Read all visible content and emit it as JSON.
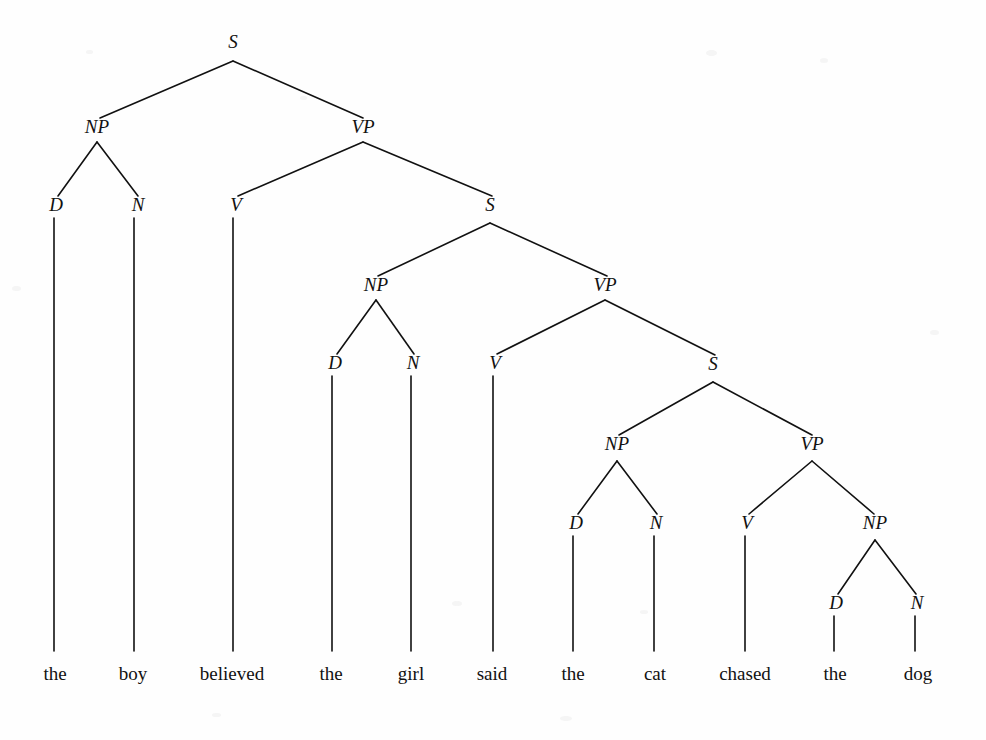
{
  "figure": {
    "kind": "constituency-syntax-tree",
    "sentence": "the boy believed the girl said the cat chased the dog",
    "background_color": "#fefefe",
    "ink_color": "#111111",
    "label_style": "italic-serif",
    "word_style": "roman-serif",
    "width": 986,
    "height": 740
  },
  "nodes": [
    {
      "id": "S1",
      "label": "S",
      "x": 233,
      "y": 48
    },
    {
      "id": "NP1",
      "label": "NP",
      "x": 97,
      "y": 133
    },
    {
      "id": "VP1",
      "label": "VP",
      "x": 363,
      "y": 133
    },
    {
      "id": "D1",
      "label": "D",
      "x": 56,
      "y": 211
    },
    {
      "id": "N1",
      "label": "N",
      "x": 138,
      "y": 211
    },
    {
      "id": "V1",
      "label": "V",
      "x": 236,
      "y": 211
    },
    {
      "id": "S2",
      "label": "S",
      "x": 490,
      "y": 211
    },
    {
      "id": "NP2",
      "label": "NP",
      "x": 376,
      "y": 291
    },
    {
      "id": "VP2",
      "label": "VP",
      "x": 605,
      "y": 291
    },
    {
      "id": "D2",
      "label": "D",
      "x": 335,
      "y": 369
    },
    {
      "id": "N2",
      "label": "N",
      "x": 413,
      "y": 369
    },
    {
      "id": "V2",
      "label": "V",
      "x": 495,
      "y": 369
    },
    {
      "id": "S3",
      "label": "S",
      "x": 713,
      "y": 370
    },
    {
      "id": "NP3",
      "label": "NP",
      "x": 617,
      "y": 450
    },
    {
      "id": "VP3",
      "label": "VP",
      "x": 812,
      "y": 450
    },
    {
      "id": "D3",
      "label": "D",
      "x": 576,
      "y": 529
    },
    {
      "id": "N3",
      "label": "N",
      "x": 656,
      "y": 529
    },
    {
      "id": "V3",
      "label": "V",
      "x": 747,
      "y": 529
    },
    {
      "id": "NP4",
      "label": "NP",
      "x": 875,
      "y": 529
    },
    {
      "id": "D4",
      "label": "D",
      "x": 836,
      "y": 609
    },
    {
      "id": "N4",
      "label": "N",
      "x": 917,
      "y": 609
    }
  ],
  "branches": [
    {
      "from": "S1",
      "to": "NP1",
      "ax": 233,
      "ay": 61,
      "bx": 100,
      "by": 118
    },
    {
      "from": "S1",
      "to": "VP1",
      "ax": 233,
      "ay": 61,
      "bx": 363,
      "by": 118
    },
    {
      "from": "NP1",
      "to": "D1",
      "ax": 97,
      "ay": 142,
      "bx": 58,
      "by": 196
    },
    {
      "from": "NP1",
      "to": "N1",
      "ax": 97,
      "ay": 142,
      "bx": 138,
      "by": 196
    },
    {
      "from": "VP1",
      "to": "V1",
      "ax": 363,
      "ay": 142,
      "bx": 238,
      "by": 196
    },
    {
      "from": "VP1",
      "to": "S2",
      "ax": 363,
      "ay": 142,
      "bx": 492,
      "by": 196
    },
    {
      "from": "S2",
      "to": "NP2",
      "ax": 490,
      "ay": 223,
      "bx": 378,
      "by": 276
    },
    {
      "from": "S2",
      "to": "VP2",
      "ax": 490,
      "ay": 223,
      "bx": 607,
      "by": 276
    },
    {
      "from": "NP2",
      "to": "D2",
      "ax": 376,
      "ay": 300,
      "bx": 337,
      "by": 354
    },
    {
      "from": "NP2",
      "to": "N2",
      "ax": 376,
      "ay": 300,
      "bx": 414,
      "by": 354
    },
    {
      "from": "VP2",
      "to": "V2",
      "ax": 605,
      "ay": 300,
      "bx": 497,
      "by": 354
    },
    {
      "from": "VP2",
      "to": "S3",
      "ax": 605,
      "ay": 300,
      "bx": 715,
      "by": 355
    },
    {
      "from": "S3",
      "to": "NP3",
      "ax": 713,
      "ay": 382,
      "bx": 619,
      "by": 435
    },
    {
      "from": "S3",
      "to": "VP3",
      "ax": 713,
      "ay": 382,
      "bx": 812,
      "by": 435
    },
    {
      "from": "NP3",
      "to": "D3",
      "ax": 617,
      "ay": 461,
      "bx": 578,
      "by": 514
    },
    {
      "from": "NP3",
      "to": "N3",
      "ax": 617,
      "ay": 461,
      "bx": 657,
      "by": 514
    },
    {
      "from": "VP3",
      "to": "V3",
      "ax": 812,
      "ay": 461,
      "bx": 749,
      "by": 514
    },
    {
      "from": "VP3",
      "to": "NP4",
      "ax": 812,
      "ay": 461,
      "bx": 874,
      "by": 514
    },
    {
      "from": "NP4",
      "to": "D4",
      "ax": 875,
      "ay": 540,
      "bx": 838,
      "by": 594
    },
    {
      "from": "NP4",
      "to": "N4",
      "ax": 875,
      "ay": 540,
      "bx": 916,
      "by": 594
    }
  ],
  "terminals": [
    {
      "id": "w1",
      "word": "the",
      "parent": "D1",
      "x": 55,
      "y": 680,
      "stem_x": 54,
      "stem_top": 218,
      "stem_bottom": 651
    },
    {
      "id": "w2",
      "word": "boy",
      "parent": "N1",
      "x": 133,
      "y": 680,
      "stem_x": 134,
      "stem_top": 218,
      "stem_bottom": 651
    },
    {
      "id": "w3",
      "word": "believed",
      "parent": "V1",
      "x": 232,
      "y": 680,
      "stem_x": 233,
      "stem_top": 218,
      "stem_bottom": 651
    },
    {
      "id": "w4",
      "word": "the",
      "parent": "D2",
      "x": 331,
      "y": 680,
      "stem_x": 332,
      "stem_top": 376,
      "stem_bottom": 651
    },
    {
      "id": "w5",
      "word": "girl",
      "parent": "N2",
      "x": 411,
      "y": 680,
      "stem_x": 411,
      "stem_top": 376,
      "stem_bottom": 651
    },
    {
      "id": "w6",
      "word": "said",
      "parent": "V2",
      "x": 492,
      "y": 680,
      "stem_x": 493,
      "stem_top": 376,
      "stem_bottom": 651
    },
    {
      "id": "w7",
      "word": "the",
      "parent": "D3",
      "x": 573,
      "y": 680,
      "stem_x": 573,
      "stem_top": 536,
      "stem_bottom": 651
    },
    {
      "id": "w8",
      "word": "cat",
      "parent": "N3",
      "x": 655,
      "y": 680,
      "stem_x": 654,
      "stem_top": 536,
      "stem_bottom": 651
    },
    {
      "id": "w9",
      "word": "chased",
      "parent": "V3",
      "x": 745,
      "y": 680,
      "stem_x": 745,
      "stem_top": 536,
      "stem_bottom": 651
    },
    {
      "id": "w10",
      "word": "the",
      "parent": "D4",
      "x": 835,
      "y": 680,
      "stem_x": 834,
      "stem_top": 616,
      "stem_bottom": 651
    },
    {
      "id": "w11",
      "word": "dog",
      "parent": "N4",
      "x": 918,
      "y": 680,
      "stem_x": 915,
      "stem_top": 616,
      "stem_bottom": 651
    }
  ],
  "specks": [
    {
      "x": 12,
      "y": 286,
      "w": 9,
      "h": 5
    },
    {
      "x": 300,
      "y": 96,
      "w": 7,
      "h": 4
    },
    {
      "x": 706,
      "y": 50,
      "w": 11,
      "h": 6
    },
    {
      "x": 820,
      "y": 58,
      "w": 8,
      "h": 5
    },
    {
      "x": 452,
      "y": 601,
      "w": 10,
      "h": 5
    },
    {
      "x": 640,
      "y": 610,
      "w": 8,
      "h": 4
    },
    {
      "x": 212,
      "y": 713,
      "w": 9,
      "h": 4
    },
    {
      "x": 560,
      "y": 716,
      "w": 12,
      "h": 5
    },
    {
      "x": 86,
      "y": 50,
      "w": 7,
      "h": 4
    },
    {
      "x": 930,
      "y": 330,
      "w": 9,
      "h": 5
    }
  ]
}
